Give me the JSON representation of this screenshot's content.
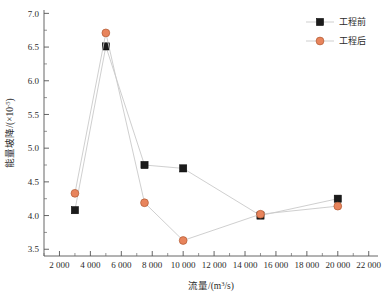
{
  "chart_data": {
    "type": "line",
    "title": "",
    "xlabel": "流量/(m³/s)",
    "ylabel": "能量坡降/(×10⁻⁵)",
    "xlim": [
      1000,
      22600
    ],
    "ylim": [
      3.4,
      7.05
    ],
    "grid": false,
    "legend_position": "top-right",
    "x_ticks": [
      "2 000",
      "4 000",
      "6 000",
      "8 000",
      "10 000",
      "12 000",
      "14 000",
      "16 000",
      "18 000",
      "20 000",
      "22 000"
    ],
    "x_tick_values": [
      2000,
      4000,
      6000,
      8000,
      10000,
      12000,
      14000,
      16000,
      18000,
      20000,
      22000
    ],
    "y_ticks": [
      "3.5",
      "4.0",
      "4.5",
      "5.0",
      "5.5",
      "6.0",
      "6.5",
      "7.0"
    ],
    "y_tick_values": [
      3.5,
      4.0,
      4.5,
      5.0,
      5.5,
      6.0,
      6.5,
      7.0
    ],
    "series": [
      {
        "name": "工程前",
        "marker": "square",
        "color": "#1b1b1b",
        "line_color": "#c9c9c9",
        "x": [
          3000,
          5000,
          7500,
          10000,
          15000,
          20000
        ],
        "values": [
          4.08,
          6.51,
          4.75,
          4.7,
          4.0,
          4.25
        ]
      },
      {
        "name": "工程后",
        "marker": "circle",
        "color": "#e8845c",
        "line_color": "#c9c9c9",
        "x": [
          3000,
          5000,
          7500,
          10000,
          15000,
          20000
        ],
        "values": [
          4.33,
          6.71,
          4.19,
          3.63,
          4.02,
          4.14
        ]
      }
    ]
  },
  "axes": {
    "x_title": "流量/(m³/s)",
    "y_title_main": "能量坡降/(×10",
    "y_title_sup": "-5",
    "y_title_tail": ")"
  },
  "legend": {
    "items": [
      {
        "label": "工程前",
        "marker": "square",
        "color": "#1b1b1b"
      },
      {
        "label": "工程后",
        "marker": "circle",
        "color": "#e8845c"
      }
    ]
  }
}
